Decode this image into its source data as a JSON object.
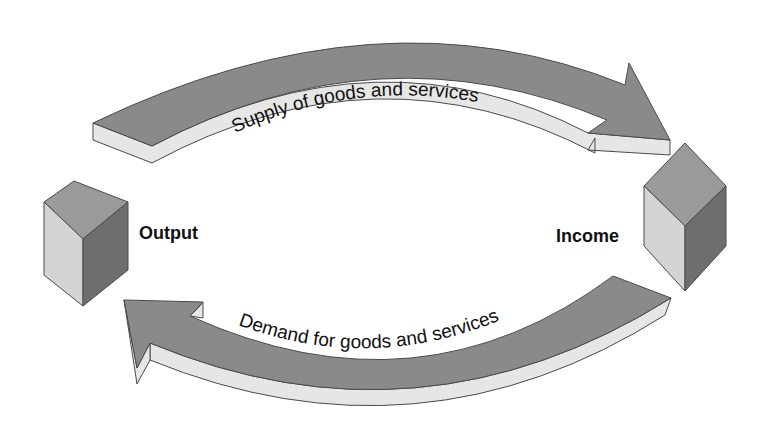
{
  "diagram": {
    "nodes": [
      {
        "id": "output",
        "label": "Output",
        "shape": "cube",
        "position": "left"
      },
      {
        "id": "income",
        "label": "Income",
        "shape": "cube",
        "position": "right"
      }
    ],
    "flows": [
      {
        "id": "supply",
        "label": "Supply of goods and services",
        "from": "output",
        "to": "income",
        "direction": "clockwise-top"
      },
      {
        "id": "demand",
        "label": "Demand for goods and services",
        "from": "income",
        "to": "output",
        "direction": "clockwise-bottom"
      }
    ],
    "colors": {
      "arrow_face": "#8a8a8a",
      "arrow_side": "#e6e6e6",
      "arrow_edge": "#4a4a4a",
      "cube_top": "#9a9a9a",
      "cube_left": "#d4d4d4",
      "cube_right": "#6e6e6e",
      "text": "#111111",
      "background": "#ffffff"
    }
  }
}
